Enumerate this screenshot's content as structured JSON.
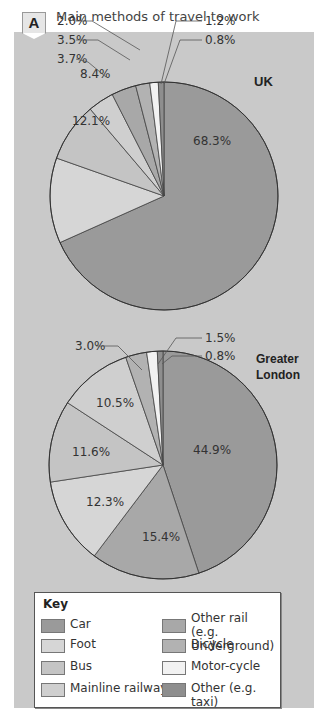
{
  "header": {
    "badge": "A",
    "title": "Main methods of travel to work"
  },
  "legend": {
    "title": "Key",
    "items": [
      {
        "label": "Car",
        "color": "#9a9a9a"
      },
      {
        "label": "Foot",
        "color": "#d6d6d6"
      },
      {
        "label": "Bus",
        "color": "#c4c4c4"
      },
      {
        "label": "Mainline railway",
        "color": "#cfcfcf"
      },
      {
        "label": "Other rail (e.g. Underground)",
        "color": "#a8a8a8"
      },
      {
        "label": "Bicycle",
        "color": "#b2b2b2"
      },
      {
        "label": "Motor-cycle",
        "color": "#f2f2f2"
      },
      {
        "label": "Other (e.g. taxi)",
        "color": "#8e8e8e"
      }
    ]
  },
  "chart_data": [
    {
      "type": "pie",
      "title": "UK",
      "categories": [
        "Car",
        "Foot",
        "Bus",
        "Mainline railway",
        "Other rail (e.g. Underground)",
        "Bicycle",
        "Motor-cycle",
        "Other (e.g. taxi)"
      ],
      "values": [
        68.3,
        12.1,
        8.4,
        3.7,
        3.5,
        2.0,
        1.2,
        0.8
      ],
      "labels": [
        "68.3%",
        "12.1%",
        "8.4%",
        "3.7%",
        "3.5%",
        "2.0%",
        "1.2%",
        "0.8%"
      ]
    },
    {
      "type": "pie",
      "title": "Greater London",
      "categories": [
        "Car",
        "Other rail (e.g. Underground)",
        "Foot",
        "Bus",
        "Mainline railway",
        "Bicycle",
        "Motor-cycle",
        "Other (e.g. taxi)"
      ],
      "values": [
        44.9,
        15.4,
        12.3,
        11.6,
        10.5,
        3.0,
        1.5,
        0.8
      ],
      "labels": [
        "44.9%",
        "15.4%",
        "12.3%",
        "11.6%",
        "10.5%",
        "3.0%",
        "1.5%",
        "0.8%"
      ]
    }
  ]
}
